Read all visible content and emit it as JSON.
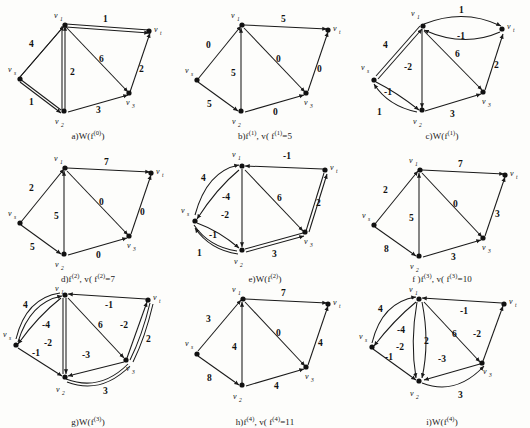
{
  "figure": {
    "vertex_labels": {
      "s": "v",
      "s_sub": "s",
      "t": "v",
      "t_sub": "t",
      "v1": "v",
      "v1_sub": "1",
      "v2": "v",
      "v2_sub": "2",
      "v3": "v",
      "v3_sub": "3"
    },
    "colors": {
      "background": "#fdfdfb",
      "ink": "#1a1a1a",
      "node": "#111111"
    }
  },
  "panels": [
    {
      "id": "a",
      "caption_prefix": "a)",
      "caption": "a)W(f",
      "caption_sup": "(0)",
      "caption_suffix": ")",
      "caption_full": "a)W(f(0))",
      "kind": "residual",
      "labels": [
        "4",
        "1",
        "2",
        "6",
        "1",
        "2",
        "3"
      ],
      "edges": [
        {
          "from": "s",
          "to": "v1",
          "label": "4"
        },
        {
          "from": "v1",
          "to": "t",
          "label": "1"
        },
        {
          "from": "v2",
          "to": "v1",
          "label": "2"
        },
        {
          "from": "v1",
          "to": "v3",
          "label": "6"
        },
        {
          "from": "s",
          "to": "v2",
          "label": "1"
        },
        {
          "from": "v3",
          "to": "t",
          "label": "2"
        },
        {
          "from": "v2",
          "to": "v3",
          "label": "3"
        }
      ]
    },
    {
      "id": "b",
      "caption_prefix": "b)",
      "caption": "b)f",
      "caption_sup": "(1)",
      "caption_suffix": ",  v( f",
      "caption_value": "=5",
      "caption_full": "b)f(1), v(f(1))=5",
      "kind": "flow",
      "value": 5,
      "labels": [
        "0",
        "5",
        "5",
        "0",
        "5",
        "0",
        "0"
      ],
      "edges": [
        {
          "from": "s",
          "to": "v1",
          "label": "0"
        },
        {
          "from": "v1",
          "to": "t",
          "label": "5"
        },
        {
          "from": "v2",
          "to": "v1",
          "label": "5"
        },
        {
          "from": "v1",
          "to": "v3",
          "label": "0"
        },
        {
          "from": "s",
          "to": "v2",
          "label": "5"
        },
        {
          "from": "v3",
          "to": "t",
          "label": "0"
        },
        {
          "from": "v2",
          "to": "v3",
          "label": "0"
        }
      ]
    },
    {
      "id": "c",
      "caption_prefix": "c)",
      "caption": "c)W(f",
      "caption_sup": "(1)",
      "caption_suffix": ")",
      "caption_full": "c)W(f(1))",
      "kind": "residual",
      "labels": [
        "4",
        "1",
        "-1",
        "-2",
        "6",
        "2",
        "-1",
        "1",
        "3"
      ],
      "edges": [
        {
          "from": "s",
          "to": "v1",
          "label": "4"
        },
        {
          "from": "v1",
          "to": "t",
          "label": "1"
        },
        {
          "from": "t",
          "to": "v1",
          "label": "-1"
        },
        {
          "from": "v1",
          "to": "v2",
          "label": "-2"
        },
        {
          "from": "v1",
          "to": "v3",
          "label": "6"
        },
        {
          "from": "v3",
          "to": "t",
          "label": "2"
        },
        {
          "from": "s",
          "to": "v2",
          "label": "-1"
        },
        {
          "from": "v2",
          "to": "s",
          "label": "1"
        },
        {
          "from": "v2",
          "to": "v3",
          "label": "3"
        }
      ]
    },
    {
      "id": "d",
      "caption_prefix": "d)",
      "caption": "d)f",
      "caption_sup": "(2)",
      "caption_suffix": ",  v( f",
      "caption_value": "=7",
      "caption_full": "d)f(2), v(f(2))=7",
      "kind": "flow",
      "value": 7,
      "labels": [
        "2",
        "7",
        "5",
        "0",
        "5",
        "0",
        "0"
      ],
      "edges": [
        {
          "from": "s",
          "to": "v1",
          "label": "2"
        },
        {
          "from": "v1",
          "to": "t",
          "label": "7"
        },
        {
          "from": "v2",
          "to": "v1",
          "label": "5"
        },
        {
          "from": "v1",
          "to": "v3",
          "label": "0"
        },
        {
          "from": "s",
          "to": "v2",
          "label": "5"
        },
        {
          "from": "v3",
          "to": "t",
          "label": "0"
        },
        {
          "from": "v2",
          "to": "v3",
          "label": "0"
        }
      ]
    },
    {
      "id": "e",
      "caption_prefix": "e)",
      "caption": "e)W(f",
      "caption_sup": "(2)",
      "caption_suffix": ")",
      "caption_full": "e)W(f(2))",
      "kind": "residual",
      "labels": [
        "4",
        "-1",
        "-4",
        "6",
        "-2",
        "2",
        "-1",
        "1",
        "3"
      ],
      "edges": [
        {
          "from": "s",
          "to": "v1",
          "label": "4"
        },
        {
          "from": "t",
          "to": "v1",
          "label": "-1"
        },
        {
          "from": "v1",
          "to": "s",
          "label": "-4"
        },
        {
          "from": "v1",
          "to": "v3",
          "label": "6"
        },
        {
          "from": "v1",
          "to": "v2",
          "label": "-2"
        },
        {
          "from": "v3",
          "to": "t",
          "label": "2"
        },
        {
          "from": "s",
          "to": "v2",
          "label": "-1"
        },
        {
          "from": "v2",
          "to": "s",
          "label": "1"
        },
        {
          "from": "v2",
          "to": "v3",
          "label": "3"
        }
      ]
    },
    {
      "id": "f",
      "caption_prefix": "f)",
      "caption": "f )f",
      "caption_sup": "(3)",
      "caption_suffix": ",  v( f",
      "caption_value": "=10",
      "caption_full": "f )f(3), v(f(3))=10",
      "kind": "flow",
      "value": 10,
      "labels": [
        "2",
        "7",
        "5",
        "0",
        "8",
        "3",
        "3"
      ],
      "edges": [
        {
          "from": "s",
          "to": "v1",
          "label": "2"
        },
        {
          "from": "v1",
          "to": "t",
          "label": "7"
        },
        {
          "from": "v2",
          "to": "v1",
          "label": "5"
        },
        {
          "from": "v1",
          "to": "v3",
          "label": "0"
        },
        {
          "from": "s",
          "to": "v2",
          "label": "8"
        },
        {
          "from": "v3",
          "to": "t",
          "label": "3"
        },
        {
          "from": "v2",
          "to": "v3",
          "label": "3"
        }
      ]
    },
    {
      "id": "g",
      "caption_prefix": "g)",
      "caption": "g)W(f",
      "caption_sup": "(3)",
      "caption_suffix": ")",
      "caption_full": "g)W(f(3))",
      "kind": "residual",
      "labels": [
        "4",
        "-4",
        "-1",
        "6",
        "-2",
        "-2",
        "2",
        "-1",
        "-3",
        "3"
      ],
      "edges": [
        {
          "from": "s",
          "to": "v1",
          "label": "4"
        },
        {
          "from": "v1",
          "to": "s",
          "label": "-4"
        },
        {
          "from": "t",
          "to": "v1",
          "label": "-1"
        },
        {
          "from": "v1",
          "to": "v3",
          "label": "6"
        },
        {
          "from": "v1",
          "to": "v2",
          "label": "-2"
        },
        {
          "from": "v3",
          "to": "t",
          "label": "-2"
        },
        {
          "from": "t",
          "to": "v3",
          "label": "2"
        },
        {
          "from": "s",
          "to": "v2",
          "label": "-1"
        },
        {
          "from": "v3",
          "to": "v2",
          "label": "-3"
        },
        {
          "from": "v2",
          "to": "v3",
          "label": "3"
        }
      ]
    },
    {
      "id": "h",
      "caption_prefix": "h)",
      "caption": "h)f",
      "caption_sup": "(4)",
      "caption_suffix": ", v( f",
      "caption_value": "=11",
      "caption_full": "h)f(4), v(f(4))=11",
      "kind": "flow",
      "value": 11,
      "labels": [
        "3",
        "7",
        "4",
        "0",
        "8",
        "4",
        "4"
      ],
      "edges": [
        {
          "from": "s",
          "to": "v1",
          "label": "3"
        },
        {
          "from": "v1",
          "to": "t",
          "label": "7"
        },
        {
          "from": "v2",
          "to": "v1",
          "label": "4"
        },
        {
          "from": "v1",
          "to": "v3",
          "label": "0"
        },
        {
          "from": "s",
          "to": "v2",
          "label": "8"
        },
        {
          "from": "v3",
          "to": "t",
          "label": "4"
        },
        {
          "from": "v2",
          "to": "v3",
          "label": "4"
        }
      ]
    },
    {
      "id": "i",
      "caption_prefix": "i)",
      "caption": "i)W(f",
      "caption_sup": "(4)",
      "caption_suffix": ")",
      "caption_full": "i)W(f(4))",
      "kind": "residual",
      "labels": [
        "4",
        "-4",
        "-1",
        "6",
        "-2",
        "-2",
        "2",
        "-1",
        "-3",
        "3"
      ],
      "edges": [
        {
          "from": "s",
          "to": "v1",
          "label": "4"
        },
        {
          "from": "v1",
          "to": "s",
          "label": "-4"
        },
        {
          "from": "t",
          "to": "v1",
          "label": "-1"
        },
        {
          "from": "v1",
          "to": "v3",
          "label": "6"
        },
        {
          "from": "v1",
          "to": "v2",
          "label": "-2"
        },
        {
          "from": "v1",
          "to": "v2b",
          "label": "2"
        },
        {
          "from": "v3",
          "to": "t",
          "label": "-2"
        },
        {
          "from": "s",
          "to": "v2",
          "label": "-1"
        },
        {
          "from": "v3",
          "to": "v2",
          "label": "-3"
        },
        {
          "from": "v2",
          "to": "v3",
          "label": "3"
        }
      ]
    }
  ]
}
